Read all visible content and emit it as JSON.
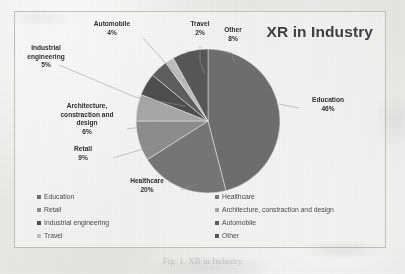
{
  "chart_data": {
    "type": "pie",
    "title": "XR in Industry",
    "categories": [
      "Education",
      "Healthcare",
      "Retail",
      "Architecture, constraction and design",
      "Industrial engineering",
      "Automobile",
      "Travel",
      "Other"
    ],
    "values": [
      46,
      20,
      9,
      6,
      5,
      4,
      2,
      8
    ],
    "unit": "%",
    "legend_position": "bottom",
    "grid": false,
    "slice_colors": [
      "#6f6f6f",
      "#777777",
      "#8e8e8e",
      "#a9a9a9",
      "#4f4f4f",
      "#5f5f5f",
      "#c0c0c0",
      "#585858"
    ],
    "data_labels": [
      {
        "name": "Education",
        "pct": "46%"
      },
      {
        "name": "Healthcare",
        "pct": "20%"
      },
      {
        "name": "Retail",
        "pct": "9%"
      },
      {
        "name": "Architecture, constraction and design",
        "pct": "6%"
      },
      {
        "name": "Industrial engineering",
        "pct": "5%"
      },
      {
        "name": "Automobile",
        "pct": "4%"
      },
      {
        "name": "Travel",
        "pct": "2%"
      },
      {
        "name": "Other",
        "pct": "8%"
      }
    ]
  },
  "title": "XR in Industry",
  "labels": {
    "automobile_name": "Automobile",
    "automobile_pct": "4%",
    "travel_name": "Travel",
    "travel_pct": "2%",
    "other_name": "Other",
    "other_pct": "8%",
    "industrial_name": "Industrial engineering",
    "industrial_pct": "5%",
    "architecture_name": "Architecture, constraction and design",
    "architecture_pct": "6%",
    "retail_name": "Retail",
    "retail_pct": "9%",
    "healthcare_name": "Healthcare",
    "healthcare_pct": "20%",
    "education_name": "Education",
    "education_pct": "46%"
  },
  "legend": {
    "left": [
      {
        "label": "Education",
        "color": "#6f6f6f"
      },
      {
        "label": "Retail",
        "color": "#8e8e8e"
      },
      {
        "label": "Industrial engineering",
        "color": "#4f4f4f"
      },
      {
        "label": "Travel",
        "color": "#c0c0c0"
      }
    ],
    "right": [
      {
        "label": "Healthcare",
        "color": "#777777"
      },
      {
        "label": "Architecture, constraction and design",
        "color": "#a9a9a9"
      },
      {
        "label": "Automobile",
        "color": "#5f5f5f"
      },
      {
        "label": "Other",
        "color": "#585858"
      }
    ]
  },
  "caption": "Fig. 1. XR in Industry"
}
